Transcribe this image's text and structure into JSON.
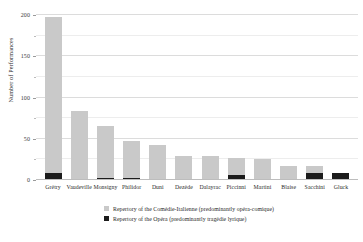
{
  "chart_data": {
    "type": "bar",
    "subtype": "stacked",
    "title": "",
    "xlabel": "",
    "ylabel": "Number of Performances",
    "ylim": [
      0,
      200
    ],
    "yticks": [
      0,
      50,
      100,
      150,
      200
    ],
    "ytick_labels": [
      "0",
      "50",
      "100",
      "150",
      "200"
    ],
    "minor_yticks": [
      25,
      75,
      125,
      175
    ],
    "grid": true,
    "grid_axis": "y",
    "legend_position": "bottom-center",
    "categories": [
      "Grétry",
      "Vaudeville",
      "Monsigny",
      "Philidor",
      "Duni",
      "Dezède",
      "Dalayrac",
      "Piccinni",
      "Martini",
      "Blaise",
      "Sacchini",
      "Gluck"
    ],
    "series": [
      {
        "name": "Repertory of the Comédie-Italienne (predominantly opéra-comique)",
        "color": "#c9c9c9",
        "values": [
          189,
          84,
          63,
          45,
          42,
          28,
          29,
          21,
          26,
          17,
          8,
          0
        ]
      },
      {
        "name": "Repertory of the Opéra (predominantly tragédie lyrique)",
        "color": "#1c1c1c",
        "values": [
          9,
          0,
          3,
          2,
          0,
          1,
          0,
          6,
          0,
          0,
          9,
          8
        ]
      }
    ],
    "totals": [
      198,
      84,
      66,
      47,
      42,
      29,
      29,
      27,
      26,
      17,
      17,
      8
    ]
  },
  "legend": {
    "items": [
      {
        "swatch": "comedie-italienne-swatch",
        "label": "Repertory of the Comédie-Italienne (predominantly opéra-comique)"
      },
      {
        "swatch": "opera-swatch",
        "label": "Repertory of the Opéra (predominantly tragédie lyrique)"
      }
    ]
  },
  "colors": {
    "comedie_italienne": "#c9c9c9",
    "opera": "#1c1c1c",
    "gridline": "#dcdcdc",
    "background": "#ffffff",
    "text": "#2b2b2b"
  }
}
